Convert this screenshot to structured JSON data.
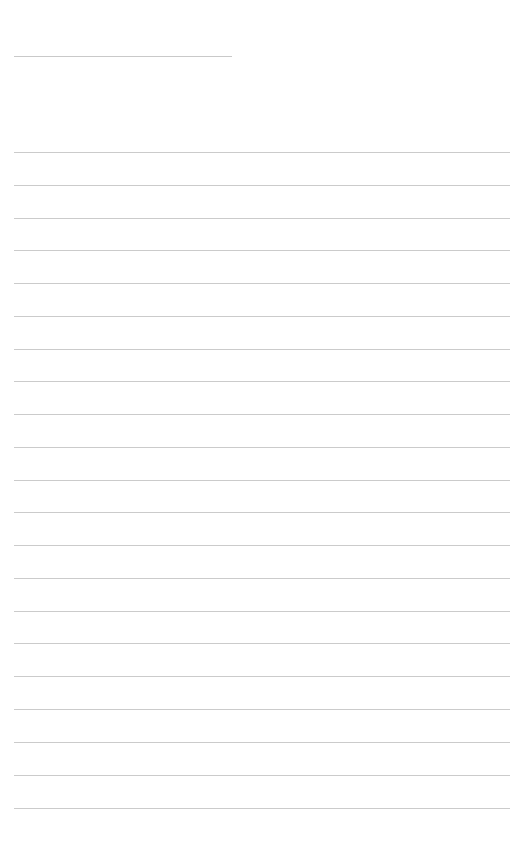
{
  "page": {
    "title": "",
    "width": 525,
    "height": 860,
    "background_color": "#ffffff"
  },
  "theme": {
    "rule_color": "#cccccc",
    "title_rule_color": "#c9c9c9",
    "body_rule_color": "#cbcbcb",
    "paper_color": "#ffffff"
  },
  "title_field": {
    "label": "",
    "value": "",
    "rule": {
      "x": 14,
      "y": 56,
      "width": 218,
      "thickness": 1
    }
  },
  "body": {
    "line_count": 21,
    "first_line_y": 152,
    "line_spacing": 32.8,
    "line_x": 14,
    "line_width": 496,
    "line_thickness": 1,
    "lines": [
      {
        "index": 1,
        "y": 152,
        "text": ""
      },
      {
        "index": 2,
        "y": 185,
        "text": ""
      },
      {
        "index": 3,
        "y": 218,
        "text": ""
      },
      {
        "index": 4,
        "y": 250,
        "text": ""
      },
      {
        "index": 5,
        "y": 283,
        "text": ""
      },
      {
        "index": 6,
        "y": 316,
        "text": ""
      },
      {
        "index": 7,
        "y": 349,
        "text": ""
      },
      {
        "index": 8,
        "y": 381,
        "text": ""
      },
      {
        "index": 9,
        "y": 414,
        "text": ""
      },
      {
        "index": 10,
        "y": 447,
        "text": ""
      },
      {
        "index": 11,
        "y": 480,
        "text": ""
      },
      {
        "index": 12,
        "y": 512,
        "text": ""
      },
      {
        "index": 13,
        "y": 545,
        "text": ""
      },
      {
        "index": 14,
        "y": 578,
        "text": ""
      },
      {
        "index": 15,
        "y": 611,
        "text": ""
      },
      {
        "index": 16,
        "y": 643,
        "text": ""
      },
      {
        "index": 17,
        "y": 676,
        "text": ""
      },
      {
        "index": 18,
        "y": 709,
        "text": ""
      },
      {
        "index": 19,
        "y": 742,
        "text": ""
      },
      {
        "index": 20,
        "y": 775,
        "text": ""
      },
      {
        "index": 21,
        "y": 808,
        "text": ""
      }
    ]
  }
}
